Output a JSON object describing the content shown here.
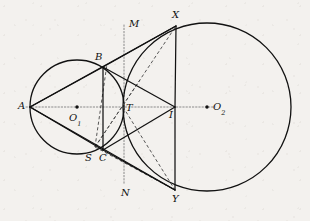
{
  "figure": {
    "type": "geometry-diagram",
    "width": 310,
    "height": 221,
    "background_color": "#f3f1ee",
    "stroke_color": "#111111",
    "dashed_color": "#444444",
    "dotted_color": "#8a8a8a"
  },
  "labels": {
    "A": "A",
    "B": "B",
    "C": "C",
    "S": "S",
    "T": "T",
    "I": "I",
    "M": "M",
    "N": "N",
    "X": "X",
    "Y": "Y",
    "O1_main": "O",
    "O1_sub": "1",
    "O2_main": "O",
    "O2_sub": "2"
  },
  "points": {
    "A": {
      "x": 30,
      "y": 107,
      "label_x": 18,
      "label_y": 101
    },
    "B": {
      "x": 103,
      "y": 67,
      "label_x": 95,
      "label_y": 52
    },
    "C": {
      "x": 103,
      "y": 150,
      "label_x": 99,
      "label_y": 153
    },
    "S": {
      "x": 95,
      "y": 147,
      "label_x": 85,
      "label_y": 153
    },
    "T": {
      "x": 123,
      "y": 107,
      "label_x": 126,
      "label_y": 103
    },
    "I": {
      "x": 175,
      "y": 107,
      "label_x": 169,
      "label_y": 110
    },
    "M": {
      "x": 124,
      "y": 22,
      "label_x": 129,
      "label_y": 19
    },
    "N": {
      "x": 124,
      "y": 186,
      "label_x": 121,
      "label_y": 188
    },
    "X": {
      "x": 176,
      "y": 26,
      "label_x": 172,
      "label_y": 10
    },
    "Y": {
      "x": 175,
      "y": 190,
      "label_x": 172,
      "label_y": 194
    },
    "O1": {
      "x": 77,
      "y": 107,
      "label_x": 69,
      "label_y": 113
    },
    "O2": {
      "x": 207,
      "y": 107,
      "label_x": 213,
      "label_y": 102
    }
  },
  "circles": [
    {
      "name": "small-circle",
      "cx": 77,
      "cy": 107,
      "r": 47
    },
    {
      "name": "large-circle",
      "cx": 207,
      "cy": 107,
      "r": 84
    }
  ],
  "solid_segments": [
    {
      "name": "segment-AB",
      "x1": 30,
      "y1": 107,
      "x2": 103,
      "y2": 67
    },
    {
      "name": "segment-AC",
      "x1": 30,
      "y1": 107,
      "x2": 103,
      "y2": 150
    },
    {
      "name": "segment-BC",
      "x1": 103,
      "y1": 67,
      "x2": 103,
      "y2": 150
    },
    {
      "name": "segment-BI",
      "x1": 103,
      "y1": 67,
      "x2": 175,
      "y2": 107
    },
    {
      "name": "segment-CI",
      "x1": 103,
      "y1": 150,
      "x2": 175,
      "y2": 107
    },
    {
      "name": "segment-BX",
      "x1": 103,
      "y1": 67,
      "x2": 176,
      "y2": 26
    },
    {
      "name": "segment-CY",
      "x1": 103,
      "y1": 150,
      "x2": 175,
      "y2": 190
    },
    {
      "name": "segment-XI",
      "x1": 176,
      "y1": 26,
      "x2": 175,
      "y2": 107
    },
    {
      "name": "segment-IY",
      "x1": 175,
      "y1": 107,
      "x2": 175,
      "y2": 190
    },
    {
      "name": "ray-A-to-X-extension",
      "x1": 30,
      "y1": 107,
      "x2": 176,
      "y2": 26
    },
    {
      "name": "ray-A-to-Y-extension",
      "x1": 30,
      "y1": 107,
      "x2": 175,
      "y2": 190
    }
  ],
  "dashed_segments": [
    {
      "name": "dashed-SB",
      "x1": 95,
      "y1": 147,
      "x2": 107,
      "y2": 64
    },
    {
      "name": "dashed-SX",
      "x1": 95,
      "y1": 147,
      "x2": 176,
      "y2": 26
    },
    {
      "name": "dashed-ST",
      "x1": 95,
      "y1": 147,
      "x2": 140,
      "y2": 80
    },
    {
      "name": "dashed-SY",
      "x1": 95,
      "y1": 147,
      "x2": 175,
      "y2": 190
    },
    {
      "name": "dashed-TY",
      "x1": 123,
      "y1": 107,
      "x2": 175,
      "y2": 190
    }
  ],
  "dotted_segments": [
    {
      "name": "axis-horizontal",
      "x1": 26,
      "y1": 107,
      "x2": 215,
      "y2": 107
    },
    {
      "name": "axis-vertical-MN",
      "x1": 124,
      "y1": 25,
      "x2": 124,
      "y2": 184
    }
  ],
  "center_dots": [
    {
      "name": "dot-O1",
      "x": 77,
      "y": 107
    },
    {
      "name": "dot-O2",
      "x": 207,
      "y": 107
    }
  ]
}
